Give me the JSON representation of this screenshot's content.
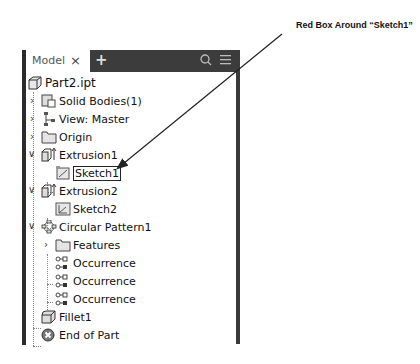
{
  "annotation": {
    "text": "Red Box Around “Sketch1”",
    "arrow_target": "Sketch1"
  },
  "panel": {
    "tab_label": "Model",
    "close_icon": "×",
    "add_icon": "+",
    "search_icon": "search-icon",
    "menu_icon": "menu-icon"
  },
  "tree": [
    {
      "label": "Part2.ipt",
      "icon": "part-icon",
      "level": 0
    },
    {
      "label": "Solid Bodies(1)",
      "icon": "solid-bodies-icon",
      "level": 1,
      "expander": "collapsed"
    },
    {
      "label": "View: Master",
      "icon": "view-icon",
      "level": 1,
      "expander": "collapsed"
    },
    {
      "label": "Origin",
      "icon": "folder-icon",
      "level": 1,
      "expander": "collapsed"
    },
    {
      "label": "Extrusion1",
      "icon": "extrusion-icon",
      "level": 1,
      "expander": "expanded"
    },
    {
      "label": "Sketch1",
      "icon": "sketch-icon",
      "level": 2,
      "selected": true
    },
    {
      "label": "Extrusion2",
      "icon": "extrusion-icon",
      "level": 1,
      "expander": "expanded"
    },
    {
      "label": "Sketch2",
      "icon": "sketch-icon",
      "level": 2
    },
    {
      "label": "Circular Pattern1",
      "icon": "circular-pattern-icon",
      "level": 1,
      "expander": "expanded"
    },
    {
      "label": "Features",
      "icon": "folder-icon",
      "level": 2,
      "expander": "collapsed"
    },
    {
      "label": "Occurrence",
      "icon": "occurrence-icon",
      "level": 2
    },
    {
      "label": "Occurrence",
      "icon": "occurrence-icon",
      "level": 2
    },
    {
      "label": "Occurrence",
      "icon": "occurrence-icon",
      "level": 2
    },
    {
      "label": "Fillet1",
      "icon": "fillet-icon",
      "level": 1
    },
    {
      "label": "End of Part",
      "icon": "end-of-part-icon",
      "level": 1
    }
  ]
}
